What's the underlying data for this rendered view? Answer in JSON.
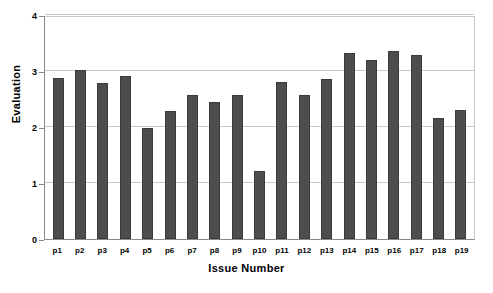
{
  "chart_data": {
    "type": "bar",
    "title": "",
    "xlabel": "Issue Number",
    "ylabel": "Evaluation",
    "categories": [
      "p1",
      "p2",
      "p3",
      "p4",
      "p5",
      "p6",
      "p7",
      "p8",
      "p9",
      "p10",
      "p11",
      "p12",
      "p13",
      "p14",
      "p15",
      "p16",
      "p17",
      "p18",
      "p19"
    ],
    "values": [
      2.88,
      3.01,
      2.78,
      2.91,
      1.99,
      2.28,
      2.57,
      2.45,
      2.57,
      1.21,
      2.8,
      2.57,
      2.86,
      3.32,
      3.19,
      3.35,
      3.29,
      2.16,
      2.3
    ],
    "ylim": [
      0,
      4
    ],
    "yticks": [
      0,
      1,
      2,
      3,
      4
    ],
    "ytick_labels": [
      "0",
      "1",
      "2",
      "3",
      "4"
    ],
    "grid": true,
    "legend": false,
    "bar_color": "#4d4d4d",
    "grid_color": "#c9c9c9",
    "axis_color": "#8a8a8a",
    "background": "#ffffff"
  }
}
